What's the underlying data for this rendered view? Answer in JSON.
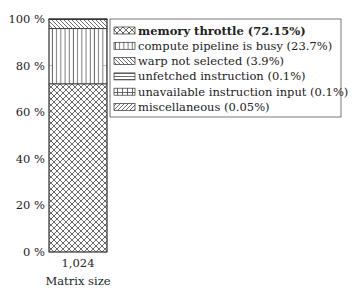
{
  "chart_data": {
    "type": "bar",
    "stacked": true,
    "title": "",
    "xlabel": "Matrix size",
    "ylabel": "",
    "categories": [
      "1,024"
    ],
    "ylim": [
      0,
      100
    ],
    "yticks": [
      0,
      20,
      40,
      60,
      80,
      100
    ],
    "ytick_labels": [
      "0 %",
      "20 %",
      "40 %",
      "60 %",
      "80 %",
      "100 %"
    ],
    "grid": false,
    "legend_position": "right",
    "series": [
      {
        "name": "memory throttle (72.15%)",
        "values": [
          72.15
        ],
        "pattern": "crosshatch",
        "bold": true
      },
      {
        "name": "compute pipeline is busy (23.7%)",
        "values": [
          23.7
        ],
        "pattern": "vertical"
      },
      {
        "name": "warp not selected (3.9%)",
        "values": [
          3.9
        ],
        "pattern": "north-west-lines"
      },
      {
        "name": "unfetched instruction (0.1%)",
        "values": [
          0.1
        ],
        "pattern": "horizontal"
      },
      {
        "name": "unavailable instruction input (0.1%)",
        "values": [
          0.1
        ],
        "pattern": "grid"
      },
      {
        "name": "miscellaneous (0.05%)",
        "values": [
          0.05
        ],
        "pattern": "north-east-lines"
      }
    ],
    "colors": {
      "stroke": "#333333",
      "background": "#ffffff"
    }
  }
}
